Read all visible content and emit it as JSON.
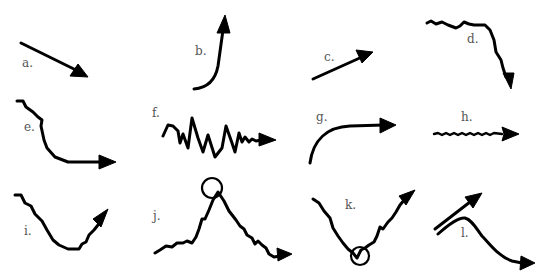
{
  "diagram": {
    "items": [
      {
        "id": "a",
        "label": "a.",
        "shape": "straight line descending to lower-right",
        "highlight": ""
      },
      {
        "id": "b",
        "label": "b.",
        "shape": "flat curve bending sharply upward",
        "highlight": ""
      },
      {
        "id": "c",
        "label": "c.",
        "shape": "straight line ascending to upper-right",
        "highlight": ""
      },
      {
        "id": "d",
        "label": "d.",
        "shape": "wavy flat line then steep drop",
        "highlight": ""
      },
      {
        "id": "e",
        "label": "e.",
        "shape": "jagged decline then flat to the right",
        "highlight": ""
      },
      {
        "id": "f",
        "label": "f.",
        "shape": "highly volatile zigzag settling to the right",
        "highlight": ""
      },
      {
        "id": "g",
        "label": "g.",
        "shape": "steep rise curving into flat",
        "highlight": ""
      },
      {
        "id": "h",
        "label": "h.",
        "shape": "small wavy horizontal line",
        "highlight": ""
      },
      {
        "id": "i",
        "label": "i.",
        "shape": "decline, bottom, then rise (U-shape)",
        "highlight": ""
      },
      {
        "id": "j",
        "label": "j.",
        "shape": "rise to a peak then decline",
        "highlight": "circled peak"
      },
      {
        "id": "k",
        "label": "k.",
        "shape": "decline to a trough then rise",
        "highlight": "circled trough"
      },
      {
        "id": "l",
        "label": "l.",
        "shape": "two lines diverging: one rising, one peaking then falling",
        "highlight": ""
      }
    ]
  }
}
